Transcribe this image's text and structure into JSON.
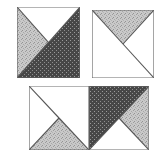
{
  "figure": {
    "title": "",
    "background_color": "#ffffff",
    "outline_color": "#555555"
  },
  "fills": {
    "white": "#ffffff",
    "light_stipple": "#c2c2c2",
    "light_stipple_dots": "#9a9a9a",
    "dark_dotted": "#4a4a4a",
    "dark_dotted_dots": "#8c8c8c"
  },
  "blocks": [
    {
      "name": "top-left-block",
      "label": "Block 1",
      "x": 17,
      "y": 7,
      "w": 63,
      "h": 71,
      "division": "half-square-diagonal-with-quarter-left",
      "pieces": [
        {
          "name": "upper-white-triangle",
          "fill": "white"
        },
        {
          "name": "left-light-triangle",
          "fill": "light_stipple"
        },
        {
          "name": "lower-right-dark-triangle",
          "fill": "dark_dotted"
        }
      ]
    },
    {
      "name": "top-right-block",
      "label": "Block 2",
      "x": 92,
      "y": 10,
      "w": 62,
      "h": 68,
      "division": "quarter-square-x",
      "pieces": [
        {
          "name": "top-light-triangle",
          "fill": "light_stipple"
        },
        {
          "name": "left-white-triangle",
          "fill": "white"
        },
        {
          "name": "right-white-triangle",
          "fill": "white"
        },
        {
          "name": "bottom-white-triangle",
          "fill": "white"
        }
      ]
    },
    {
      "name": "bottom-left-square",
      "label": "Block 3a",
      "x": 29,
      "y": 86,
      "w": 60,
      "h": 64,
      "division": "quarter-square-x",
      "pieces": [
        {
          "name": "top-white-triangle",
          "fill": "white"
        },
        {
          "name": "left-white-triangle",
          "fill": "white"
        },
        {
          "name": "right-white-triangle",
          "fill": "white"
        },
        {
          "name": "bottom-light-triangle",
          "fill": "light_stipple"
        }
      ]
    },
    {
      "name": "bottom-right-square",
      "label": "Block 3b",
      "x": 89,
      "y": 86,
      "w": 60,
      "h": 64,
      "division": "half-square-diagonal-with-quarter-right",
      "pieces": [
        {
          "name": "upper-left-dark-triangle",
          "fill": "dark_dotted"
        },
        {
          "name": "right-light-triangle",
          "fill": "light_stipple"
        },
        {
          "name": "bottom-white-triangle",
          "fill": "white"
        }
      ]
    }
  ]
}
